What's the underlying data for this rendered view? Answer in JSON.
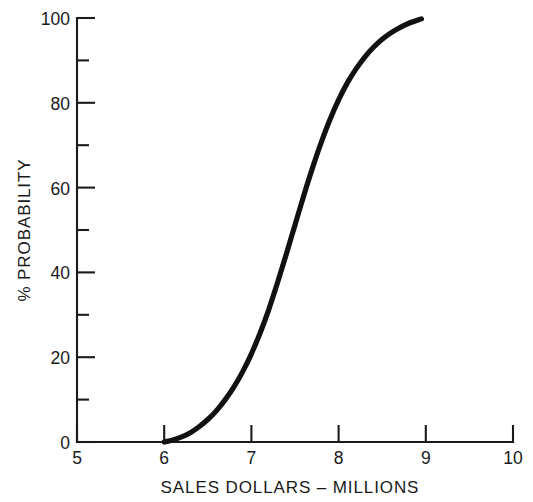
{
  "chart_data": {
    "type": "line",
    "title": "",
    "subtitle": "",
    "xlabel": "SALES DOLLARS – MILLIONS",
    "ylabel": "% PROBABILITY",
    "xlim": [
      5,
      10
    ],
    "ylim": [
      0,
      100
    ],
    "grid": false,
    "legend": null,
    "xticks": [
      5,
      6,
      7,
      8,
      9,
      10
    ],
    "xticklabels": [
      "5",
      "6",
      "7",
      "8",
      "9",
      "10"
    ],
    "xticks_minor": [],
    "yticks": [
      0,
      20,
      40,
      60,
      80,
      100
    ],
    "yticklabels": [
      "0",
      "20",
      "40",
      "60",
      "80",
      "100"
    ],
    "yticks_minor": [
      10,
      30,
      50,
      70,
      90
    ],
    "series": [
      {
        "name": "cumulative probability",
        "x": [
          6.0,
          6.1,
          6.2,
          6.3,
          6.4,
          6.5,
          6.6,
          6.7,
          6.8,
          6.9,
          7.0,
          7.1,
          7.2,
          7.3,
          7.4,
          7.5,
          7.6,
          7.7,
          7.8,
          7.9,
          8.0,
          8.1,
          8.2,
          8.3,
          8.4,
          8.5,
          8.6,
          8.7,
          8.8,
          8.95
        ],
        "y": [
          0.0,
          0.5,
          1.2,
          2.2,
          3.6,
          5.3,
          7.4,
          10.0,
          13.0,
          16.6,
          20.8,
          25.7,
          31.3,
          37.6,
          44.3,
          51.2,
          58.1,
          64.6,
          70.6,
          76.0,
          80.7,
          84.7,
          88.0,
          90.8,
          93.1,
          95.0,
          96.5,
          97.7,
          98.7,
          99.8
        ]
      }
    ],
    "annotations": []
  },
  "axes": {
    "x_title": "SALES DOLLARS – MILLIONS",
    "y_title": "% PROBABILITY",
    "x_tick_0": "5",
    "x_tick_1": "6",
    "x_tick_2": "7",
    "x_tick_3": "8",
    "x_tick_4": "9",
    "x_tick_5": "10",
    "y_tick_0": "0",
    "y_tick_1": "20",
    "y_tick_2": "40",
    "y_tick_3": "60",
    "y_tick_4": "80",
    "y_tick_5": "100"
  },
  "style": {
    "curve_color": "#111111",
    "axis_color": "#1a1a1a",
    "background": "#ffffff"
  }
}
